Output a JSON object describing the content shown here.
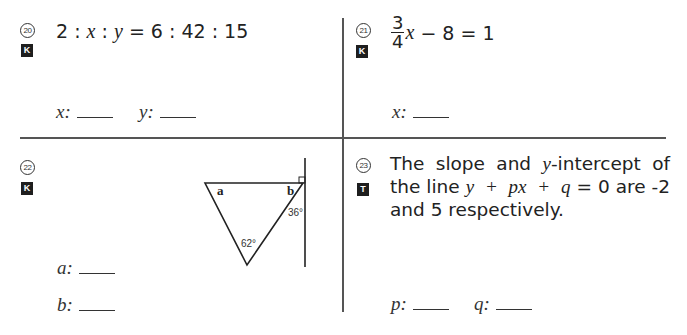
{
  "questions": [
    {
      "number": "20",
      "badge": "K",
      "equation": {
        "lhs": "2 : ",
        "v1": "x",
        "sep": " : ",
        "v2": "y",
        "rhs": " = 6 : 42 : 15"
      },
      "answers": [
        {
          "label": "x:"
        },
        {
          "label": "y:"
        }
      ]
    },
    {
      "number": "21",
      "badge": "K",
      "equation": {
        "frac_num": "3",
        "frac_den": "4",
        "v1": "x",
        "rhs": " − 8 = 1"
      },
      "answers": [
        {
          "label": "x:"
        }
      ]
    },
    {
      "number": "22",
      "badge": "K",
      "figure": {
        "angle_a_label": "a",
        "angle_b_label": "b",
        "angle_bottom": "62°",
        "angle_right": "36°",
        "right_angle_marker": true
      },
      "answers": [
        {
          "label": "a:"
        },
        {
          "label": "b:"
        }
      ]
    },
    {
      "number": "23",
      "badge": "T",
      "text": {
        "p1": "The slope and ",
        "v_y": "y",
        "p2": "-intercept of the line ",
        "expr": "y + px + q",
        "p3": " = 0 are -2 and 5 respectively."
      },
      "answers": [
        {
          "label": "p:"
        },
        {
          "label": "q:"
        }
      ]
    }
  ]
}
